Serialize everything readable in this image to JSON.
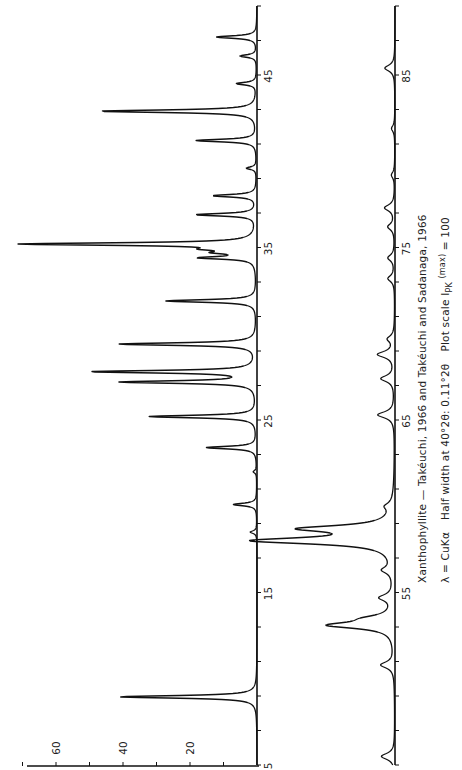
{
  "chart_data": {
    "type": "line",
    "title": "Xanthophyllite — Takéuchi, 1966 and Takéuchi and Sadanaga, 1966",
    "subtitle": "λ = CuKα  Half width at 40°2θ: 0.11°2θ  Plot scale I_PK (max) = 100",
    "xlabel": "2θ (degrees)",
    "ylabel": "Intensity",
    "orientation": "rotated-90 (2θ axis vertical, intensity horizontal)",
    "intensity_ticks": [
      20,
      40,
      60
    ],
    "intensity_range": [
      0,
      70
    ],
    "panels": [
      {
        "name": "upper-trace",
        "x_range": [
          5,
          49
        ],
        "x_tick_labels": [
          5,
          15,
          25,
          35,
          45
        ],
        "x_minor_tick_step": 2,
        "peaks": [
          {
            "two_theta": 8.95,
            "intensity": 41
          },
          {
            "two_theta": 18.5,
            "intensity": 2
          },
          {
            "two_theta": 20.1,
            "intensity": 7
          },
          {
            "two_theta": 22.0,
            "intensity": 1
          },
          {
            "two_theta": 23.4,
            "intensity": 15
          },
          {
            "two_theta": 25.2,
            "intensity": 32
          },
          {
            "two_theta": 27.2,
            "intensity": 40
          },
          {
            "two_theta": 27.8,
            "intensity": 49
          },
          {
            "two_theta": 29.4,
            "intensity": 41
          },
          {
            "two_theta": 31.9,
            "intensity": 27
          },
          {
            "two_theta": 34.4,
            "intensity": 16
          },
          {
            "two_theta": 34.7,
            "intensity": 9
          },
          {
            "two_theta": 34.9,
            "intensity": 10
          },
          {
            "two_theta": 35.2,
            "intensity": 70
          },
          {
            "two_theta": 36.9,
            "intensity": 18
          },
          {
            "two_theta": 38.0,
            "intensity": 13
          },
          {
            "two_theta": 39.6,
            "intensity": 3
          },
          {
            "two_theta": 41.2,
            "intensity": 18
          },
          {
            "two_theta": 42.9,
            "intensity": 47
          },
          {
            "two_theta": 44.5,
            "intensity": 6
          },
          {
            "two_theta": 46.1,
            "intensity": 5
          },
          {
            "two_theta": 47.2,
            "intensity": 12
          }
        ]
      },
      {
        "name": "lower-trace",
        "x_range": [
          45,
          89
        ],
        "x_tick_labels": [
          55,
          65,
          75,
          85
        ],
        "x_minor_tick_step": 2,
        "peaks": [
          {
            "two_theta": 45.5,
            "intensity": 4
          },
          {
            "two_theta": 50.8,
            "intensity": 4
          },
          {
            "two_theta": 53.1,
            "intensity": 19
          },
          {
            "two_theta": 53.5,
            "intensity": 6
          },
          {
            "two_theta": 54.7,
            "intensity": 4
          },
          {
            "two_theta": 56.3,
            "intensity": 3
          },
          {
            "two_theta": 58.0,
            "intensity": 41
          },
          {
            "two_theta": 58.7,
            "intensity": 26
          },
          {
            "two_theta": 60.0,
            "intensity": 2
          },
          {
            "two_theta": 65.3,
            "intensity": 5
          },
          {
            "two_theta": 67.4,
            "intensity": 4
          },
          {
            "two_theta": 68.8,
            "intensity": 5
          },
          {
            "two_theta": 69.7,
            "intensity": 2
          },
          {
            "two_theta": 73.2,
            "intensity": 2
          },
          {
            "two_theta": 74.4,
            "intensity": 2
          },
          {
            "two_theta": 76.2,
            "intensity": 2
          },
          {
            "two_theta": 77.3,
            "intensity": 3
          },
          {
            "two_theta": 79.2,
            "intensity": 1
          },
          {
            "two_theta": 81.9,
            "intensity": 1
          },
          {
            "two_theta": 85.4,
            "intensity": 3
          }
        ]
      }
    ],
    "grid": false,
    "legend": null
  },
  "caption": {
    "line1": "Xanthophyllite — Takéuchi, 1966 and Takéuchi and Sadanaga, 1966",
    "line2_lambda": "λ = CuKα",
    "line2_halfwidth": "Half width at 40°2θ: 0.11°2θ",
    "line2_plotscale_prefix": "Plot scale I",
    "line2_plotscale_sub": "PK",
    "line2_plotscale_sup": "(max)",
    "line2_plotscale_suffix": " = 100"
  },
  "style": {
    "line_color": "#111111",
    "axis_color": "#111111",
    "text_color": "#222222",
    "background": "#ffffff"
  }
}
